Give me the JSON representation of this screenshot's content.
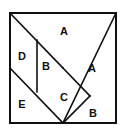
{
  "figure": {
    "name": "tangram-square",
    "type": "geometric-diagram",
    "background_color": "#ffffff",
    "stroke_color": "#111111",
    "fill_color": "#ffffff",
    "outer_stroke_width": 2,
    "inner_stroke_width": 1.6,
    "square": {
      "left": 10,
      "top": 13,
      "right": 116,
      "bottom": 123
    },
    "vertices": {
      "top_left": [
        10,
        13
      ],
      "top_right": [
        116,
        13
      ],
      "bottom_left": [
        10,
        123
      ],
      "bottom_right": [
        116,
        123
      ],
      "center": [
        63,
        68
      ],
      "left_mid": [
        10,
        68
      ],
      "bottom_mid": [
        63,
        123
      ],
      "tl_to_center_mid": [
        37,
        40
      ],
      "vertical_bottom": [
        37,
        92
      ],
      "small_b_apex": [
        90,
        96
      ],
      "right_mid_low": [
        116,
        123
      ]
    },
    "pieces": [
      {
        "id": "piece-a-top",
        "label": "A",
        "shape": "large-triangle",
        "points": "10,13 116,13 63,68",
        "label_pos": [
          64,
          31
        ]
      },
      {
        "id": "piece-a-right",
        "label": "A",
        "shape": "large-triangle",
        "points": "116,13 116,123 63,68",
        "label_pos": [
          92,
          68
        ]
      },
      {
        "id": "piece-d-left",
        "label": "D",
        "shape": "parallelogram",
        "points": "10,13 37,40 37,92 10,68",
        "label_pos": [
          22,
          56
        ]
      },
      {
        "id": "piece-b-center",
        "label": "B",
        "shape": "medium-triangle",
        "points": "37,40 63,68 37,92",
        "label_pos": [
          46,
          66
        ]
      },
      {
        "id": "piece-e-bottomleft",
        "label": "E",
        "shape": "large-triangle",
        "points": "10,68 37,92 63,123 10,123",
        "label_pos": [
          22,
          104
        ]
      },
      {
        "id": "piece-c-square",
        "label": "C",
        "shape": "square-rotated",
        "points": "37,92 63,68 90,96 63,123",
        "label_pos": [
          64,
          97
        ]
      },
      {
        "id": "piece-b-bottomright",
        "label": "B",
        "shape": "small-triangle",
        "points": "90,96 116,123 63,123",
        "label_pos": [
          93,
          113
        ]
      }
    ],
    "edges": [
      {
        "name": "outer-square",
        "d": "M10,13 L116,13 L116,123 L10,123 Z"
      },
      {
        "name": "diagonal-tl-br",
        "d": "M10,13 L63,68"
      },
      {
        "name": "diagonal-tr-bl",
        "d": "M116,13 L63,123"
      },
      {
        "name": "diagonal-left-mid",
        "d": "M10,68 L63,123"
      },
      {
        "name": "vertical-inner",
        "d": "M37,40 L37,92"
      },
      {
        "name": "diagonal-center-to-b",
        "d": "M63,68 L90,96"
      },
      {
        "name": "diagonal-b-to-bottom-mid",
        "d": "M90,96 L63,123"
      }
    ]
  }
}
